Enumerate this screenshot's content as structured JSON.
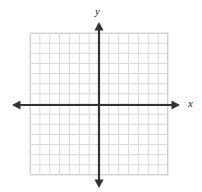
{
  "figure": {
    "kind": "cartesian-coordinate-grid",
    "width": 202,
    "height": 192,
    "background_color": "#ffffff"
  },
  "labels": {
    "y_axis": "y",
    "x_axis": "x"
  },
  "colors": {
    "grid_line": "#d9d9d9",
    "grid_border": "#d0d0d0",
    "axis": "#333333",
    "label_text": "#1a1a1a",
    "background": "#ffffff"
  },
  "chart_data": {
    "type": "scatter",
    "title": "",
    "xlabel": "x",
    "ylabel": "y",
    "series": [],
    "x": [],
    "values": [],
    "xlim": [
      -7,
      7
    ],
    "ylim": [
      -7,
      7
    ],
    "xticks": [
      -7,
      -6,
      -5,
      -4,
      -3,
      -2,
      -1,
      0,
      1,
      2,
      3,
      4,
      5,
      6,
      7
    ],
    "yticks": [
      -7,
      -6,
      -5,
      -4,
      -3,
      -2,
      -1,
      0,
      1,
      2,
      3,
      4,
      5,
      6,
      7
    ],
    "xtick_labels": [],
    "ytick_labels": [],
    "grid": true,
    "grid_columns": 14,
    "grid_rows": 14,
    "legend": null,
    "annotations": []
  },
  "geometry": {
    "grid_left": 30,
    "grid_top": 33,
    "grid_right": 168,
    "grid_bottom": 175,
    "cell_width": 9.857,
    "cell_height": 10.143,
    "origin_x": 99,
    "origin_y": 105,
    "x_axis_start": 12,
    "x_axis_end": 180,
    "y_axis_start": 22,
    "y_axis_end": 188
  }
}
